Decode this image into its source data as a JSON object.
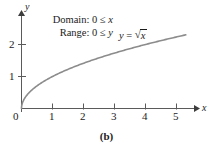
{
  "figure": {
    "caption": "(b)",
    "background_color": "#ffffff",
    "axis_color": "#4a4a4a",
    "curve_color": "#8c8c8c",
    "text_color": "#1b1b1b"
  },
  "annotations": {
    "domain_label": "Domain:",
    "domain_value": "0 ≤",
    "domain_var": "x",
    "range_label": "Range:",
    "range_value": "0 ≤",
    "range_var": "y",
    "equation_lhs": "y",
    "equation_eq": "=",
    "equation_radical_sign": "√",
    "equation_radicand": "x",
    "equation_full": "y = √x"
  },
  "chart_data": {
    "type": "line",
    "title": "",
    "subtitle": "",
    "xlabel": "x",
    "ylabel": "y",
    "xlim": [
      0,
      5.5
    ],
    "ylim": [
      0,
      2.45
    ],
    "grid": false,
    "legend": "none",
    "function": "y = sqrt(x)",
    "xticks": [
      1,
      2,
      3,
      4,
      5
    ],
    "xtick_labels": [
      "1",
      "2",
      "3",
      "4",
      "5"
    ],
    "yticks": [
      1,
      2
    ],
    "ytick_labels": [
      "1",
      "2"
    ],
    "origin_label": "0",
    "series": [
      {
        "name": "y = √x",
        "x": [
          0,
          0.05,
          0.1,
          0.2,
          0.3,
          0.4,
          0.5,
          0.75,
          1,
          1.25,
          1.5,
          1.75,
          2,
          2.5,
          3,
          3.5,
          4,
          4.5,
          5,
          5.3
        ],
        "values": [
          0,
          0.224,
          0.316,
          0.447,
          0.548,
          0.632,
          0.707,
          0.866,
          1.0,
          1.118,
          1.225,
          1.323,
          1.414,
          1.581,
          1.732,
          1.871,
          2.0,
          2.121,
          2.236,
          2.302
        ]
      }
    ],
    "annotations": [
      {
        "text": "Domain: 0 ≤ x",
        "x_px": 113,
        "y_px": 19
      },
      {
        "text": "Range: 0 ≤ y",
        "x_px": 113,
        "y_px": 32
      },
      {
        "text": "y = √x",
        "x_px": 119,
        "y_px": 34
      }
    ]
  },
  "axes": {
    "x_axis_name": "x",
    "y_axis_name": "y",
    "origin": "0"
  }
}
